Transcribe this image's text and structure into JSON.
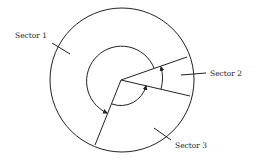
{
  "diagram": {
    "type": "disk-sector-diagram",
    "labels": {
      "sector1": "Sector 1",
      "sector2": "Sector 2",
      "sector3": "Sector 3"
    },
    "colors": {
      "stroke": "#222222",
      "background": "#ffffff"
    }
  }
}
